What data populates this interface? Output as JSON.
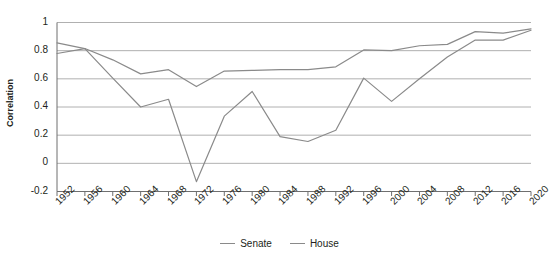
{
  "chart_data": {
    "type": "line",
    "title": "",
    "xlabel": "",
    "ylabel": "Correlation",
    "grid": true,
    "legend_position": "bottom",
    "x": [
      1952,
      1956,
      1960,
      1964,
      1968,
      1972,
      1976,
      1980,
      1984,
      1988,
      1992,
      1996,
      2000,
      2004,
      2008,
      2012,
      2016,
      2020
    ],
    "categories": [
      "1952",
      "1956",
      "1960",
      "1964",
      "1968",
      "1972",
      "1976",
      "1980",
      "1984",
      "1988",
      "1992",
      "1996",
      "2000",
      "2004",
      "2008",
      "2012",
      "2016",
      "2020"
    ],
    "xlim": [
      1952,
      2020
    ],
    "ylim": [
      -0.2,
      1
    ],
    "yticks": [
      -0.2,
      0,
      0.2,
      0.4,
      0.6,
      0.8,
      1
    ],
    "ytick_labels": [
      "-0.2",
      "0",
      "0.2",
      "0.4",
      "0.6",
      "0.8",
      "1"
    ],
    "series": [
      {
        "name": "Senate",
        "color": "#8a8a8a",
        "values": [
          0.855,
          0.815,
          0.735,
          0.635,
          0.665,
          0.545,
          0.655,
          0.66,
          0.665,
          0.665,
          0.685,
          0.805,
          0.8,
          0.835,
          0.845,
          0.935,
          0.925,
          0.955
        ]
      },
      {
        "name": "House",
        "color": "#8a8a8a",
        "values": [
          0.78,
          0.815,
          0.605,
          0.4,
          0.455,
          -0.13,
          0.335,
          0.51,
          0.19,
          0.155,
          0.235,
          0.605,
          0.44,
          0.6,
          0.755,
          0.875,
          0.875,
          0.945
        ]
      }
    ]
  },
  "legend": {
    "items": [
      {
        "label": "Senate"
      },
      {
        "label": "House"
      }
    ]
  },
  "y_axis": {
    "title": "Correlation"
  }
}
